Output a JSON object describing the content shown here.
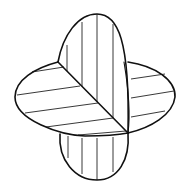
{
  "diagram": {
    "colors": {
      "stroke": "#111111",
      "background": "#ffffff"
    },
    "shapes": [
      {
        "name": "vertical-plane",
        "hatch": "vertical lines"
      },
      {
        "name": "horizontal-plane",
        "hatch": "near-horizontal lines"
      },
      {
        "name": "intersection-line",
        "style": "diagonal"
      }
    ]
  }
}
